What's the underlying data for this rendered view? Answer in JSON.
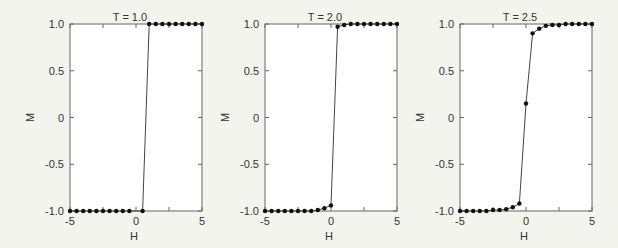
{
  "chart_data": [
    {
      "type": "line",
      "title": "T = 1.0",
      "xlabel": "H",
      "ylabel": "M",
      "xlim": [
        -5,
        5
      ],
      "ylim": [
        -1.0,
        1.0
      ],
      "xticks": [
        "-5",
        "0",
        "5"
      ],
      "yticks": [
        "1.0",
        "0.5",
        "0",
        "-0.5",
        "-1.0"
      ],
      "grid": false,
      "x": [
        -5,
        -4.5,
        -4,
        -3.5,
        -3,
        -2.5,
        -2,
        -1.5,
        -1,
        -0.5,
        0,
        0.5,
        1.0,
        1.5,
        2,
        2.5,
        3,
        3.5,
        4,
        4.5,
        5
      ],
      "points": [
        [
          -5,
          -1
        ],
        [
          -4.5,
          -1
        ],
        [
          -4,
          -1
        ],
        [
          -3.5,
          -1
        ],
        [
          -3,
          -1
        ],
        [
          -2.5,
          -1
        ],
        [
          -2,
          -1
        ],
        [
          -1.5,
          -1
        ],
        [
          -1,
          -1
        ],
        [
          -0.5,
          -1
        ],
        [
          0.5,
          -1
        ],
        [
          1.0,
          1
        ],
        [
          1.5,
          1
        ],
        [
          2,
          1
        ],
        [
          2.5,
          1
        ],
        [
          3,
          1
        ],
        [
          3.5,
          1
        ],
        [
          4,
          1
        ],
        [
          4.5,
          1
        ],
        [
          5,
          1
        ]
      ]
    },
    {
      "type": "line",
      "title": "T = 2.0",
      "xlabel": "H",
      "ylabel": "M",
      "xlim": [
        -5,
        5
      ],
      "ylim": [
        -1.0,
        1.0
      ],
      "xticks": [
        "-5",
        "0",
        "5"
      ],
      "yticks": [
        "1.0",
        "0.5",
        "0",
        "-0.5",
        "-1.0"
      ],
      "grid": false,
      "points": [
        [
          -5,
          -1
        ],
        [
          -4.5,
          -1
        ],
        [
          -4,
          -1
        ],
        [
          -3.5,
          -1
        ],
        [
          -3,
          -1
        ],
        [
          -2.5,
          -1
        ],
        [
          -2,
          -1
        ],
        [
          -1.5,
          -1
        ],
        [
          -1,
          -0.99
        ],
        [
          -0.5,
          -0.97
        ],
        [
          0,
          -0.94
        ],
        [
          0.5,
          0.97
        ],
        [
          1,
          0.99
        ],
        [
          1.5,
          1
        ],
        [
          2,
          1
        ],
        [
          2.5,
          1
        ],
        [
          3,
          1
        ],
        [
          3.5,
          1
        ],
        [
          4,
          1
        ],
        [
          4.5,
          1
        ],
        [
          5,
          1
        ]
      ]
    },
    {
      "type": "line",
      "title": "T = 2.5",
      "xlabel": "H",
      "ylabel": "M",
      "xlim": [
        -5,
        5
      ],
      "ylim": [
        -1.0,
        1.0
      ],
      "xticks": [
        "-5",
        "0",
        "5"
      ],
      "yticks": [
        "1.0",
        "0.5",
        "0",
        "-0.5",
        "-1.0"
      ],
      "grid": false,
      "points": [
        [
          -5,
          -1
        ],
        [
          -4.5,
          -1
        ],
        [
          -4,
          -1
        ],
        [
          -3.5,
          -1
        ],
        [
          -3,
          -1
        ],
        [
          -2.5,
          -0.99
        ],
        [
          -2,
          -0.99
        ],
        [
          -1.5,
          -0.98
        ],
        [
          -1,
          -0.96
        ],
        [
          -0.5,
          -0.92
        ],
        [
          0,
          0.15
        ],
        [
          0.5,
          0.9
        ],
        [
          1,
          0.95
        ],
        [
          1.5,
          0.98
        ],
        [
          2,
          0.99
        ],
        [
          2.5,
          0.99
        ],
        [
          3,
          1
        ],
        [
          3.5,
          1
        ],
        [
          4,
          1
        ],
        [
          4.5,
          1
        ],
        [
          5,
          1
        ]
      ]
    }
  ]
}
